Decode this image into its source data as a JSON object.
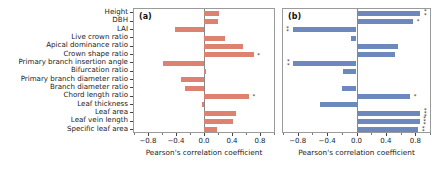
{
  "chart_data": {
    "type": "bar",
    "orientation": "horizontal",
    "title": "",
    "xlabel": "Pearson's correlation coefficient",
    "ylabel": "",
    "xlim": [
      -1.0,
      1.0
    ],
    "xticks": [
      -0.8,
      -0.4,
      0.0,
      0.4,
      0.8
    ],
    "xticklabels": [
      "−0.8",
      "−0.4",
      "0.0",
      "0.4",
      "0.8"
    ],
    "grid": false,
    "legend": "none",
    "categories": [
      "Height",
      "DBH",
      "LAI",
      "Live crown ratio",
      "Apical dominance ratio",
      "Crown shape ratio",
      "Primary branch insertion angle",
      "Bifurcation ratio",
      "Primary branch diameter ratio",
      "Branch diameter ratio",
      "Chord length ratio",
      "Leaf thickness",
      "Leaf area",
      "Leaf vein length",
      "Specific leaf area"
    ],
    "panels": [
      {
        "tag": "(a)",
        "color": "#dd8270",
        "xlabel": "Pearson's correlation coefficient",
        "values": [
          0.22,
          0.2,
          -0.42,
          0.3,
          0.56,
          0.71,
          -0.59,
          0.03,
          -0.33,
          -0.27,
          0.64,
          -0.03,
          0.45,
          0.42,
          0.19
        ],
        "significance": [
          "",
          "",
          "",
          "",
          "",
          "*",
          "",
          "",
          "",
          "",
          "*",
          "",
          "",
          "",
          ""
        ]
      },
      {
        "tag": "(b)",
        "color": "#6d88bd",
        "xlabel": "Pearson's correlation coefficient",
        "values": [
          0.87,
          0.77,
          -0.87,
          -0.08,
          0.56,
          0.52,
          -0.86,
          -0.19,
          0.02,
          -0.2,
          0.73,
          -0.5,
          0.87,
          0.86,
          0.84
        ],
        "significance": [
          "**",
          "*",
          "**",
          "",
          "",
          "",
          "**",
          "",
          "",
          "",
          "*",
          "",
          "***",
          "***",
          "**"
        ]
      }
    ]
  }
}
